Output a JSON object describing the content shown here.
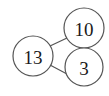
{
  "diagram": {
    "type": "number-bond",
    "background_color": "#ffffff",
    "stroke_color": "#555555",
    "text_color": "#1a1a1a",
    "stroke_width": 1.2,
    "nodes": [
      {
        "id": "whole",
        "role": "whole",
        "value": "13",
        "cx": 33,
        "cy": 56,
        "r": 20,
        "font_size": 19
      },
      {
        "id": "part-top",
        "role": "part",
        "value": "10",
        "cx": 84,
        "cy": 28,
        "r": 20,
        "font_size": 19
      },
      {
        "id": "part-bottom",
        "role": "part",
        "value": "3",
        "cx": 84,
        "cy": 67,
        "r": 19,
        "font_size": 19
      }
    ],
    "links": [
      {
        "id": "link-whole-top",
        "from": "whole",
        "to": "part-top",
        "x1": 50,
        "y1": 46,
        "x2": 67,
        "y2": 38
      },
      {
        "id": "link-whole-bottom",
        "from": "whole",
        "to": "part-bottom",
        "x1": 50,
        "y1": 65,
        "x2": 67,
        "y2": 74
      }
    ]
  }
}
